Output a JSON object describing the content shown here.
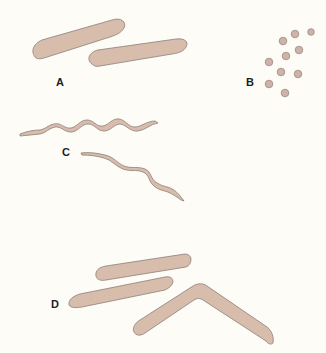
{
  "figure": {
    "type": "bacterial morphology illustration",
    "colors": {
      "background": "#fdfcf7",
      "cell_fill": "#d9bdab",
      "cell_outline": "#8c7c76",
      "label": "#1e1e1e"
    },
    "panels": [
      {
        "id": "A",
        "label": "A",
        "shape": "rod (bacillus)",
        "count": 2
      },
      {
        "id": "B",
        "label": "B",
        "shape": "spherical (coccus)",
        "count": 10
      },
      {
        "id": "C",
        "label": "C",
        "shape": "spiral (spirillum)",
        "count": 2
      },
      {
        "id": "D",
        "label": "D",
        "shape": "tapered rods / curved (fusiform)",
        "count": 3
      }
    ]
  }
}
